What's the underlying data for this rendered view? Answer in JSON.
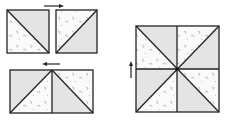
{
  "colors": {
    "background": "#ffffff",
    "stroke": "#222222",
    "shaded": "#e4e4e4",
    "patterned": "#fafafa",
    "speck": "#b8b8b8"
  },
  "diagram": {
    "step1_units": [
      {
        "id": "hst-left",
        "x": 7,
        "y": 10,
        "w": 42,
        "h": 43,
        "diagonal": "tl-br",
        "shaded": "upper-right",
        "patterned": "lower-left"
      },
      {
        "id": "hst-right",
        "x": 56,
        "y": 10,
        "w": 41,
        "h": 43,
        "diagonal": "bl-tr",
        "shaded": "lower-right",
        "patterned": "upper-left"
      }
    ],
    "step1_arrow": {
      "direction": "right",
      "x1": 44,
      "y1": 6,
      "x2": 63,
      "y2": 6
    },
    "step2_pair": {
      "x": 10,
      "y": 70,
      "w": 83,
      "h": 43,
      "divider_x": 52,
      "halves": [
        {
          "diagonal": "bl-tr",
          "shaded": "upper-left",
          "patterned": "lower-right"
        },
        {
          "diagonal": "tl-br",
          "shaded": "lower-left",
          "patterned": "upper-right"
        }
      ]
    },
    "step2_arrow": {
      "direction": "left",
      "x1": 60,
      "y1": 64,
      "x2": 43,
      "y2": 64
    },
    "step3_block": {
      "x": 136,
      "y": 26,
      "w": 83,
      "h": 86,
      "center": [
        177,
        69
      ],
      "triangles": [
        {
          "position": "top-left-upper",
          "fill": "shaded"
        },
        {
          "position": "top-left-lower",
          "fill": "patterned"
        },
        {
          "position": "top-right-upper",
          "fill": "patterned"
        },
        {
          "position": "top-right-lower",
          "fill": "shaded"
        },
        {
          "position": "bottom-right-upper",
          "fill": "patterned"
        },
        {
          "position": "bottom-right-lower",
          "fill": "shaded"
        },
        {
          "position": "bottom-left-upper",
          "fill": "shaded"
        },
        {
          "position": "bottom-left-lower",
          "fill": "patterned"
        }
      ]
    },
    "step3_arrow": {
      "direction": "up",
      "x1": 131,
      "y1": 78,
      "x2": 131,
      "y2": 62
    }
  }
}
